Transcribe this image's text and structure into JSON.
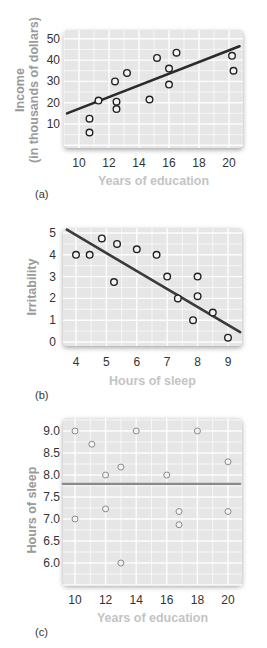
{
  "chart_data": [
    {
      "id": "a",
      "type": "scatter",
      "panel_label": "(a)",
      "title": "",
      "xlabel": "Years of education",
      "ylabel": "Income (in thousands of dollars)",
      "ylabel_lines": [
        "Income",
        "(in thousands of dollars)"
      ],
      "xticks": [
        10,
        12,
        14,
        16,
        18,
        20
      ],
      "yticks": [
        10,
        20,
        30,
        40,
        50
      ],
      "xlim": [
        9.2,
        20.7
      ],
      "ylim": [
        0,
        52
      ],
      "grid": true,
      "points": [
        {
          "x": 10.7,
          "y": 12.5
        },
        {
          "x": 10.7,
          "y": 6
        },
        {
          "x": 11.3,
          "y": 21
        },
        {
          "x": 12.4,
          "y": 30
        },
        {
          "x": 12.5,
          "y": 20.5
        },
        {
          "x": 12.5,
          "y": 17
        },
        {
          "x": 13.2,
          "y": 34
        },
        {
          "x": 14.7,
          "y": 21.5
        },
        {
          "x": 15.2,
          "y": 41
        },
        {
          "x": 16.0,
          "y": 36
        },
        {
          "x": 16.0,
          "y": 28.5
        },
        {
          "x": 16.5,
          "y": 43.5
        },
        {
          "x": 20.2,
          "y": 42
        },
        {
          "x": 20.3,
          "y": 35
        }
      ],
      "trend_line": {
        "x1": 9.2,
        "y1": 15,
        "x2": 20.7,
        "y2": 46.5,
        "color": "#2b2b2b"
      }
    },
    {
      "id": "b",
      "type": "scatter",
      "panel_label": "(b)",
      "title": "",
      "xlabel": "Hours of sleep",
      "ylabel": "Irritability",
      "xticks": [
        4,
        5,
        6,
        7,
        8,
        9
      ],
      "yticks": [
        0,
        1,
        2,
        3,
        4,
        5
      ],
      "xlim": [
        3.6,
        9.4
      ],
      "ylim": [
        -0.15,
        5.2
      ],
      "grid": true,
      "points": [
        {
          "x": 4.0,
          "y": 4.0
        },
        {
          "x": 4.45,
          "y": 4.0
        },
        {
          "x": 4.85,
          "y": 4.75
        },
        {
          "x": 5.25,
          "y": 2.75
        },
        {
          "x": 5.35,
          "y": 4.5
        },
        {
          "x": 6.0,
          "y": 4.25
        },
        {
          "x": 6.65,
          "y": 4.0
        },
        {
          "x": 7.0,
          "y": 3.0
        },
        {
          "x": 7.35,
          "y": 2.0
        },
        {
          "x": 7.85,
          "y": 1.0
        },
        {
          "x": 8.0,
          "y": 3.0
        },
        {
          "x": 8.0,
          "y": 2.1
        },
        {
          "x": 8.5,
          "y": 1.35
        },
        {
          "x": 9.0,
          "y": 0.2
        }
      ],
      "trend_line": {
        "x1": 3.7,
        "y1": 5.15,
        "x2": 9.4,
        "y2": 0.45,
        "color": "#3a3a3a"
      }
    },
    {
      "id": "c",
      "type": "scatter",
      "panel_label": "(c)",
      "title": "",
      "xlabel": "Years of education",
      "ylabel": "Hours of sleep",
      "xticks": [
        10,
        12,
        14,
        16,
        18,
        20
      ],
      "ytick_labels": [
        "6.0",
        "6.5",
        "7.0",
        "7.5",
        "8.0",
        "8.5",
        "9.0"
      ],
      "yticks": [
        6.0,
        6.5,
        7.0,
        7.5,
        8.0,
        8.5,
        9.0
      ],
      "xlim": [
        9.2,
        20.8
      ],
      "ylim": [
        5.5,
        9.3
      ],
      "grid": true,
      "points": [
        {
          "x": 10.0,
          "y": 9.0
        },
        {
          "x": 10.0,
          "y": 7.0
        },
        {
          "x": 11.1,
          "y": 8.7
        },
        {
          "x": 12.0,
          "y": 8.0
        },
        {
          "x": 12.0,
          "y": 7.23
        },
        {
          "x": 13.0,
          "y": 8.18
        },
        {
          "x": 13.0,
          "y": 6.0
        },
        {
          "x": 14.0,
          "y": 9.0
        },
        {
          "x": 16.0,
          "y": 8.0
        },
        {
          "x": 16.8,
          "y": 7.17
        },
        {
          "x": 16.8,
          "y": 6.87
        },
        {
          "x": 18.0,
          "y": 9.0
        },
        {
          "x": 20.0,
          "y": 8.3
        },
        {
          "x": 20.0,
          "y": 7.17
        }
      ],
      "trend_line": {
        "x1": 9.2,
        "y1": 7.8,
        "x2": 20.8,
        "y2": 7.8,
        "color": "#8a8a8a"
      }
    }
  ],
  "layout": {
    "panels": [
      {
        "plot": {
          "left": 64,
          "top": 30,
          "width": 179,
          "height": 118
        },
        "x0px": 79,
        "xppu": 15.0,
        "y0val": 10,
        "y0px": 124,
        "yppu": 2.13,
        "tickLabelRight": 60,
        "xTickTop": 156,
        "xlabelTop": 174,
        "letterTop": 188,
        "ylabelCenterX": 27,
        "ylabelCenterY": 90
      },
      {
        "plot": {
          "left": 63,
          "top": 228,
          "width": 179,
          "height": 118
        },
        "x0px": 76,
        "xppu": 30.4,
        "y0val": 0,
        "y0px": 342,
        "yppu": 21.8,
        "tickLabelRight": 56,
        "xTickTop": 355,
        "xlabelTop": 374,
        "letterTop": 389,
        "ylabelCenterX": 32,
        "ylabelCenterY": 287
      },
      {
        "plot": {
          "left": 63,
          "top": 418,
          "width": 179,
          "height": 167
        },
        "x0px": 75,
        "xppu": 15.3,
        "y0val": 6.0,
        "y0px": 563,
        "yppu": 44.0,
        "tickLabelRight": 60,
        "xTickTop": 593,
        "xlabelTop": 611,
        "letterTop": 626,
        "ylabelCenterX": 32,
        "ylabelCenterY": 510
      }
    ]
  }
}
